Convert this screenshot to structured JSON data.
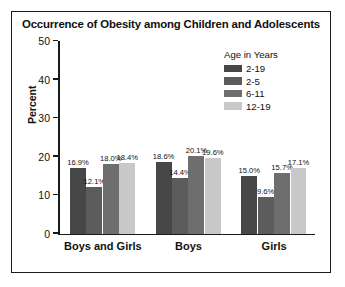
{
  "chart_data": {
    "type": "bar",
    "title": "Occurrence of Obesity among Children and Adolescents",
    "xlabel": "",
    "ylabel": "Percent",
    "ylim": [
      0,
      50
    ],
    "yticks": [
      0,
      10,
      20,
      30,
      40,
      50
    ],
    "grid": false,
    "legend_position": "top-right",
    "legend_title": "Age in Years",
    "categories": [
      "Boys and Girls",
      "Boys",
      "Girls"
    ],
    "series": [
      {
        "name": "2-19",
        "color": "#474747",
        "values": [
          16.9,
          18.6,
          15.0
        ],
        "labels": [
          "16.9%",
          "18.6%",
          "15.0%"
        ]
      },
      {
        "name": "2-5",
        "color": "#5c5c5c",
        "values": [
          12.1,
          14.4,
          9.6
        ],
        "labels": [
          "12.1%",
          "14.4%",
          "9.6%"
        ]
      },
      {
        "name": "6-11",
        "color": "#6e6e6e",
        "values": [
          18.0,
          20.1,
          15.7
        ],
        "labels": [
          "18.0%",
          "20.1%",
          "15.7%"
        ]
      },
      {
        "name": "12-19",
        "color": "#c8c8c8",
        "values": [
          18.4,
          19.6,
          17.1
        ],
        "labels": [
          "18.4%",
          "19.6%",
          "17.1%"
        ]
      }
    ]
  },
  "colors": {
    "axis": "#1a1a1a",
    "text": "#111111",
    "background": "#ffffff",
    "frame": "#1a1a1a"
  }
}
